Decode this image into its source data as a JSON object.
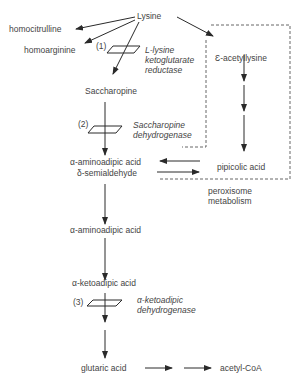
{
  "diagram": {
    "nodes": {
      "lysine": "Lysine",
      "homocitrulline": "homocitrulline",
      "homoarginine": "homoarginine",
      "saccharopine": "Saccharopine",
      "aminoadipic_semialdehyde_1": "α-aminoadipic acid",
      "aminoadipic_semialdehyde_2": "δ-semialdehyde",
      "aminoadipic_acid": "α-aminoadipic acid",
      "ketoadipic_acid": "α-ketoadipic acid",
      "glutaric_acid": "glutaric acid",
      "acetyl_coa": "acetyl-CoA",
      "acetyllysine": "Ɛ-acetyllysine",
      "pipecolic_acid": "pipicolic acid"
    },
    "enzymes": [
      {
        "number": "(1)",
        "line1": "L-lysine",
        "line2": "ketoglutarate",
        "line3": "reductase"
      },
      {
        "number": "(2)",
        "line1": "Saccharopine",
        "line2": "dehydrogenase"
      },
      {
        "number": "(3)",
        "line1": "α-ketoadipic",
        "line2": "dehydrogenase"
      }
    ],
    "compartment": {
      "line1": "peroxisome",
      "line2": "metabolism"
    },
    "colors": {
      "line": "#2a2a2a",
      "text": "#444444",
      "dashed": "#555555"
    }
  }
}
